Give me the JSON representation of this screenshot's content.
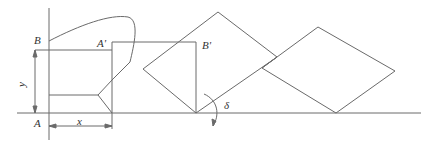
{
  "figure": {
    "labels": {
      "B": "B",
      "A_prime": "A'",
      "B_prime": "B'",
      "y": "y",
      "A": "A",
      "x": "x",
      "delta": "δ"
    },
    "stroke_color": "#6a6a6a"
  }
}
